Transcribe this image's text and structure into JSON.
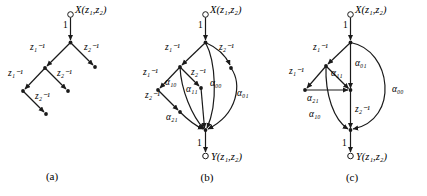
{
  "figure": {
    "name": "two-dimensional-filter-signal-flow-graphs",
    "background": "#ffffff",
    "ink": "#1a1a1a",
    "panels": [
      {
        "id": "a",
        "caption": "(a)",
        "input_label": "X(z₁,z₂)",
        "gain_label": "1",
        "output_label": "",
        "branch_labels": [
          "z₁⁻¹",
          "z₂⁻¹",
          "z₁⁻¹",
          "z₂⁻¹",
          "z₂⁻¹"
        ]
      },
      {
        "id": "b",
        "caption": "(b)",
        "input_label": "X(z₁,z₂)",
        "gain_label": "1",
        "output_gain_label": "1",
        "output_label": "Y(z₁,z₂)",
        "branch_labels": [
          "z₁⁻¹",
          "z₂⁻¹",
          "z₁⁻¹",
          "z₂⁻¹",
          "z₂⁻¹"
        ],
        "coefficient_labels": [
          "α₁₀",
          "α₁₁",
          "α₀₀",
          "α₀₁",
          "α₂₁"
        ]
      },
      {
        "id": "c",
        "caption": "(c)",
        "input_label": "X(z₁,z₂)",
        "gain_label": "1",
        "output_gain_label": "1",
        "output_label": "Y(z₁,z₂)",
        "branch_labels": [
          "z₁⁻¹",
          "z₁⁻¹",
          "z₂⁻¹"
        ],
        "coefficient_labels": [
          "α₁₁",
          "α₀₁",
          "α₀₀",
          "α₂₁",
          "α₁₀"
        ]
      }
    ]
  }
}
